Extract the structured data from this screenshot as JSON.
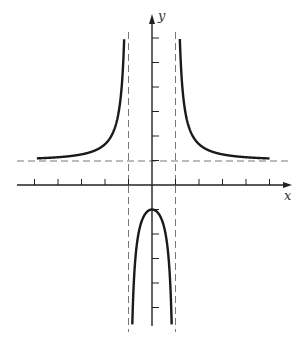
{
  "chart_data": {
    "type": "line",
    "title": "",
    "function": "y = (x^2 + 1) / (x^2 - 1)",
    "xlabel": "x",
    "ylabel": "y",
    "xlim": [
      -5,
      6
    ],
    "ylim": [
      -6,
      7
    ],
    "grid": false,
    "legend": "none",
    "x_ticks": [
      -5,
      -4,
      -3,
      -2,
      -1,
      1,
      2,
      3,
      4,
      5
    ],
    "y_ticks": [
      -5,
      -4,
      -3,
      -2,
      -1,
      1,
      2,
      3,
      4,
      5,
      6
    ],
    "asymptotes": {
      "vertical": [
        -1,
        1
      ],
      "horizontal": [
        1
      ]
    },
    "series": [
      {
        "name": "left-upper-branch",
        "x": [
          -5,
          -4,
          -3,
          -2,
          -1.5,
          -1.2,
          -1.1,
          -1.05
        ],
        "y": [
          1.083,
          1.133,
          1.25,
          1.667,
          2.6,
          4.636,
          10.5,
          20.5
        ]
      },
      {
        "name": "right-upper-branch",
        "x": [
          1.05,
          1.1,
          1.2,
          1.5,
          2,
          3,
          4,
          5
        ],
        "y": [
          20.5,
          10.5,
          4.636,
          2.6,
          1.667,
          1.25,
          1.133,
          1.083
        ]
      },
      {
        "name": "middle-lower-branch",
        "x": [
          -0.92,
          -0.8,
          -0.6,
          -0.4,
          -0.2,
          0,
          0.2,
          0.4,
          0.6,
          0.8,
          0.92
        ],
        "y": [
          -11.5,
          -4.556,
          -2.125,
          -1.381,
          -1.083,
          -1,
          -1.083,
          -1.381,
          -2.125,
          -4.556,
          -11.5
        ]
      }
    ],
    "colors": {
      "curve": "#1a1a1a",
      "axis": "#222222",
      "asymptote": "#777777"
    }
  },
  "labels": {
    "x_axis": "x",
    "y_axis": "y"
  }
}
